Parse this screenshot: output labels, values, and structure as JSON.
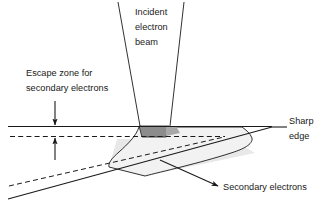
{
  "figure": {
    "type": "scientific-line-diagram",
    "background_color": "#ffffff",
    "line_color": "#1a1a1a"
  },
  "labels": {
    "incident_beam": {
      "lines": [
        "Incident",
        "electron",
        "beam"
      ],
      "line1": "Incident",
      "line2": "electron",
      "line3": "beam"
    },
    "escape_zone": {
      "lines": [
        "Escape zone for",
        "secondary electrons"
      ],
      "line1": "Escape zone for",
      "line2": "secondary electrons"
    },
    "sharp_edge": {
      "lines": [
        "Sharp",
        "edge"
      ],
      "line1": "Sharp",
      "line2": "edge"
    },
    "secondary_electrons": {
      "text": "Secondary electrons"
    }
  },
  "shapes": {
    "interaction_volume": {
      "name": "interaction-volume-bulb",
      "fill": "#f0f0f0",
      "stroke": "#1a1a1a"
    },
    "beam_entry_region": {
      "name": "beam-entry-dark-region",
      "fill": "#8c8c8c",
      "stroke": "#1a1a1a"
    },
    "escape_band": {
      "name": "escape-zone-band",
      "fill": "#e0e0e0",
      "stroke": "#1a1a1a"
    }
  },
  "colors": {
    "ink": "#1a1a1a",
    "dark_gray": "#8c8c8c",
    "mid_gray": "#e0e0e0",
    "light_gray": "#f0f0f0",
    "white": "#ffffff"
  }
}
